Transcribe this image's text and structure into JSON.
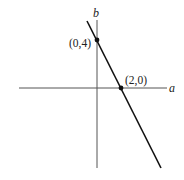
{
  "diagram": {
    "type": "line-graph",
    "axes": {
      "horizontal_label": "a",
      "vertical_label": "b"
    },
    "points": [
      {
        "label": "(0,4)",
        "a": 0,
        "b": 4
      },
      {
        "label": "(2,0)",
        "a": 2,
        "b": 0
      }
    ],
    "line": {
      "slope": -2,
      "intercept_b": 4,
      "equation": "b = 4 - 2a"
    },
    "colors": {
      "axis": "#555555",
      "line": "#111111",
      "point": "#111111",
      "background": "#ffffff"
    }
  }
}
